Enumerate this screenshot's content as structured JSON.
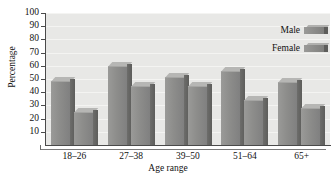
{
  "chart_data": {
    "type": "bar",
    "title": "",
    "xlabel": "Age range",
    "ylabel": "Percentage",
    "categories": [
      "18–26",
      "27–38",
      "39–50",
      "51–64",
      "65+"
    ],
    "series": [
      {
        "name": "Male",
        "values": [
          48,
          59,
          51,
          55,
          47
        ]
      },
      {
        "name": "Female",
        "values": [
          24,
          44,
          44,
          33,
          27
        ]
      }
    ],
    "ylim": [
      0,
      100
    ],
    "yticks": [
      10,
      20,
      30,
      40,
      50,
      60,
      70,
      80,
      90,
      100
    ],
    "ytick_labels": [
      "10",
      "20",
      "30",
      "40",
      "50",
      "60",
      "70",
      "80",
      "90",
      "100"
    ],
    "grid": true,
    "legend_position": "top-right",
    "legend": [
      "Male",
      "Female"
    ],
    "colors": {
      "bar_front": "#8d8d8b",
      "bar_side": "#5d5d5b",
      "bar_top": "#b6b6b4",
      "plot_background": "#e8e8e6",
      "axis": "#4a4a4a",
      "text": "#111111"
    }
  }
}
